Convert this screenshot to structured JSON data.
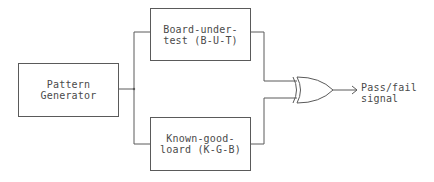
{
  "diagram": {
    "type": "block-diagram",
    "blocks": {
      "pattern_generator": {
        "line1": "Pattern",
        "line2": "Generator"
      },
      "board_under_test": {
        "line1": "Board-under-",
        "line2": "test (B-U-T)"
      },
      "known_good_board": {
        "line1": "Known-good-",
        "line2": "loard (K-G-B)"
      }
    },
    "gate": {
      "kind": "XOR"
    },
    "output": {
      "line1": "Pass/fail",
      "line2": "signal"
    },
    "colors": {
      "line": "#5a5a5a",
      "text": "#4a4a4a",
      "background": "#ffffff"
    }
  }
}
